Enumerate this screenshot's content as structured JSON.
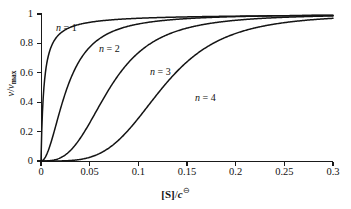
{
  "figure": {
    "name": "hill-equation-saturation-curves"
  },
  "axis": {
    "x_title_prefix": "[S]",
    "x_title_divider": "/",
    "x_title_symbol": "c",
    "x_title_superscript": "⊖",
    "y_title_numerator": "v",
    "y_title_divider": "/",
    "y_title_denominator": "v",
    "y_title_subscript": "max"
  },
  "chart_data": {
    "type": "line",
    "title": "",
    "subtitle": "",
    "xlabel": "[S]/c⊖",
    "ylabel": "v/v_max",
    "xlim": [
      0,
      0.3
    ],
    "ylim": [
      0,
      1
    ],
    "grid": false,
    "legend": "inline-annotations",
    "xticks": [
      "0",
      "0.05",
      "0.1",
      "0.15",
      "0.2",
      "0.25",
      "0.3"
    ],
    "xtick_values": [
      0,
      0.05,
      0.1,
      0.15,
      0.2,
      0.25,
      0.3
    ],
    "yticks": [
      "0",
      "0.2",
      "0.4",
      "0.6",
      "0.8",
      "1"
    ],
    "ytick_values": [
      0,
      0.2,
      0.4,
      0.6,
      0.8,
      1
    ],
    "equation": "v/v_max = [S]^n / (K^n + [S]^n)",
    "series": [
      {
        "name": "n = 1",
        "hill_coefficient": 1,
        "half_saturation_x": 0.003,
        "label_x": 0.3,
        "x": [
          0,
          0.002,
          0.004,
          0.006,
          0.01,
          0.015,
          0.02,
          0.03,
          0.05,
          0.08,
          0.1,
          0.15,
          0.2,
          0.25,
          0.3
        ],
        "values": [
          0,
          0.4,
          0.57,
          0.67,
          0.77,
          0.83,
          0.87,
          0.91,
          0.94,
          0.96,
          0.97,
          0.98,
          0.985,
          0.99,
          0.99
        ]
      },
      {
        "name": "n = 2",
        "hill_coefficient": 2,
        "half_saturation_x": 0.027,
        "x": [
          0,
          0.005,
          0.01,
          0.015,
          0.02,
          0.027,
          0.035,
          0.045,
          0.06,
          0.08,
          0.1,
          0.13,
          0.16,
          0.2,
          0.25,
          0.3
        ],
        "values": [
          0,
          0.033,
          0.12,
          0.24,
          0.36,
          0.5,
          0.63,
          0.74,
          0.83,
          0.9,
          0.932,
          0.956,
          0.97,
          0.978,
          0.986,
          0.99
        ]
      },
      {
        "name": "n = 3",
        "hill_coefficient": 3,
        "half_saturation_x": 0.071,
        "x": [
          0,
          0.01,
          0.02,
          0.03,
          0.04,
          0.05,
          0.06,
          0.071,
          0.085,
          0.1,
          0.12,
          0.15,
          0.18,
          0.22,
          0.26,
          0.3
        ],
        "values": [
          0,
          0.003,
          0.021,
          0.07,
          0.15,
          0.26,
          0.38,
          0.5,
          0.63,
          0.74,
          0.83,
          0.905,
          0.94,
          0.965,
          0.978,
          0.985
        ]
      },
      {
        "name": "n = 4",
        "hill_coefficient": 4,
        "half_saturation_x": 0.125,
        "x": [
          0,
          0.02,
          0.04,
          0.06,
          0.075,
          0.09,
          0.105,
          0.125,
          0.145,
          0.165,
          0.19,
          0.215,
          0.245,
          0.27,
          0.3
        ],
        "values": [
          0,
          0.0007,
          0.01,
          0.05,
          0.105,
          0.185,
          0.295,
          0.5,
          0.645,
          0.755,
          0.845,
          0.895,
          0.93,
          0.945,
          0.955
        ]
      }
    ],
    "annotations": [
      {
        "text": "n = 1",
        "x_px": 56,
        "y_px": 22
      },
      {
        "text": "n = 2",
        "x_px": 99,
        "y_px": 43
      },
      {
        "text": "n = 3",
        "x_px": 150,
        "y_px": 66
      },
      {
        "text": "n = 4",
        "x_px": 195,
        "y_px": 92
      }
    ]
  }
}
